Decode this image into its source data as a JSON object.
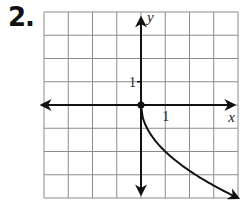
{
  "problem": {
    "number_label": "2."
  },
  "chart_data": {
    "type": "line",
    "title": "",
    "xlabel": "x",
    "ylabel": "y",
    "xlim": [
      -4,
      4
    ],
    "ylim": [
      -4,
      4
    ],
    "grid": true,
    "grid_step": 1,
    "tick_labels": {
      "x": [
        "1"
      ],
      "y": [
        "1"
      ]
    },
    "tick_values": {
      "x": [
        1
      ],
      "y": [
        1
      ]
    },
    "series": [
      {
        "name": "y = -2√x",
        "function": "-2*sqrt(x)",
        "x": [
          0,
          0.25,
          0.5,
          1,
          1.5,
          2,
          2.5,
          3,
          3.5,
          4
        ],
        "values": [
          0,
          -1,
          -1.414,
          -2,
          -2.449,
          -2.828,
          -3.162,
          -3.464,
          -3.742,
          -4
        ],
        "start_point": {
          "x": 0,
          "y": 0,
          "style": "closed-dot"
        },
        "end": "arrow"
      }
    ],
    "colors": {
      "grid": "#8c8c8c",
      "axis": "#111111",
      "curve": "#111111"
    }
  }
}
